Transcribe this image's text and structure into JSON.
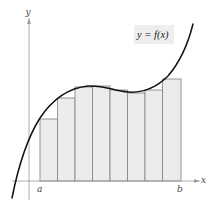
{
  "diagram": {
    "type": "riemann-sum",
    "function_label": "y = f(x)",
    "axes": {
      "x_label": "x",
      "y_label": "y",
      "interval_start_label": "a",
      "interval_end_label": "b"
    },
    "colors": {
      "curve": "#111111",
      "axis": "#9a9a9a",
      "rect_fill": "#ececec",
      "rect_stroke": "#8a8a8a",
      "label_box": "#eeeeee"
    },
    "rectangles": [
      {
        "x": 40,
        "w": 17.5,
        "top": 119
      },
      {
        "x": 57.5,
        "w": 17.5,
        "top": 98
      },
      {
        "x": 75,
        "w": 17.5,
        "top": 87
      },
      {
        "x": 92.5,
        "w": 17.5,
        "top": 86
      },
      {
        "x": 110,
        "w": 17.5,
        "top": 90
      },
      {
        "x": 127.5,
        "w": 17.5,
        "top": 93
      },
      {
        "x": 145,
        "w": 17.5,
        "top": 90
      },
      {
        "x": 162.5,
        "w": 18.5,
        "top": 79
      }
    ],
    "rectangle_count": 8
  }
}
